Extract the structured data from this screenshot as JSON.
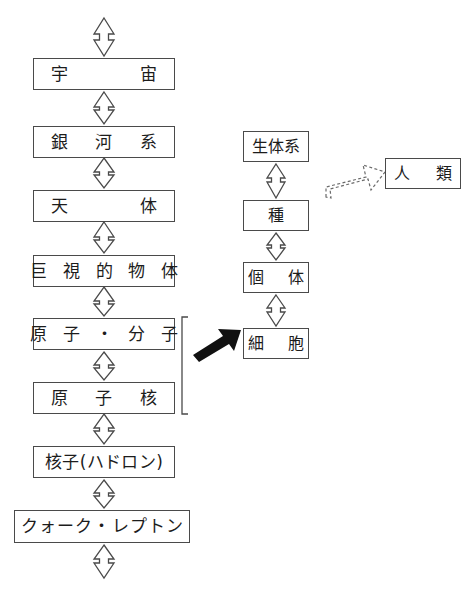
{
  "diagram": {
    "background_color": "#ffffff",
    "stroke_color": "#4a4a4a",
    "text_color": "#1c1c1c",
    "solid_arrow_color": "#111111",
    "left_column": {
      "name": "physical-hierarchy",
      "boxes": [
        {
          "id": "uchu",
          "label": "宇　　　宙"
        },
        {
          "id": "ginga",
          "label": "銀　河　系"
        },
        {
          "id": "tentai",
          "label": "天　　　体"
        },
        {
          "id": "kyoshi",
          "label": "巨 視 的 物 体"
        },
        {
          "id": "genshi",
          "label": "原 子 ・ 分 子"
        },
        {
          "id": "kaku",
          "label": "原　子　核"
        },
        {
          "id": "hadron",
          "label": "核子(ハドロン)"
        },
        {
          "id": "quark",
          "label": "クォーク・レプトン"
        }
      ]
    },
    "right_column": {
      "name": "biological-hierarchy",
      "boxes": [
        {
          "id": "seitaikei",
          "label": "生体系"
        },
        {
          "id": "shu",
          "label": "種"
        },
        {
          "id": "kotai",
          "label": "個　体"
        },
        {
          "id": "saibo",
          "label": "細　胞"
        }
      ]
    },
    "outlier_box": {
      "id": "jinrui",
      "label": "人　類"
    },
    "connectors": {
      "double_headed_label": "double-headed-arrow",
      "bracket_label": "grouping-bracket",
      "solid_arrow_label": "solid-block-arrow",
      "dashed_arrow_label": "dashed-block-arrow"
    }
  }
}
